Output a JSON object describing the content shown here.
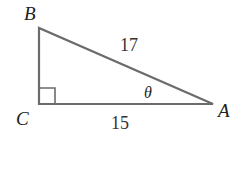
{
  "diagram": {
    "type": "right-triangle",
    "colors": {
      "stroke": "#666666",
      "text": "#222222",
      "background": "#ffffff"
    },
    "vertices": [
      {
        "name": "B",
        "label": "B",
        "x": 39,
        "y": 28
      },
      {
        "name": "C",
        "label": "C",
        "x": 39,
        "y": 104
      },
      {
        "name": "A",
        "label": "A",
        "x": 213,
        "y": 104
      }
    ],
    "sides": [
      {
        "between": "B-A",
        "label": "17"
      },
      {
        "between": "C-A",
        "label": "15"
      }
    ],
    "angle": {
      "at": "A",
      "label": "θ"
    },
    "right_angle_at": "C"
  }
}
